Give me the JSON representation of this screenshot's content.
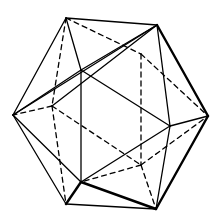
{
  "figure": {
    "stroke_color": "#000000",
    "background": "#ffffff",
    "vertices": {
      "A": [
        66,
        18
      ],
      "B": [
        157,
        25
      ],
      "C": [
        13,
        115
      ],
      "D": [
        81,
        70
      ],
      "E": [
        170,
        126
      ],
      "F": [
        208,
        116
      ],
      "G": [
        81,
        182
      ],
      "H": [
        66,
        204
      ],
      "I": [
        156,
        209
      ],
      "J": [
        52,
        106
      ],
      "K": [
        141,
        54
      ],
      "L": [
        141,
        165
      ]
    },
    "solid_edges": [
      [
        "A",
        "B"
      ],
      [
        "A",
        "C"
      ],
      [
        "A",
        "D"
      ],
      [
        "B",
        "D"
      ],
      [
        "B",
        "F"
      ],
      [
        "B",
        "E"
      ],
      [
        "B",
        "C"
      ],
      [
        "C",
        "D"
      ],
      [
        "C",
        "G"
      ],
      [
        "C",
        "H"
      ],
      [
        "D",
        "G"
      ],
      [
        "D",
        "E"
      ],
      [
        "E",
        "F"
      ],
      [
        "E",
        "G"
      ],
      [
        "E",
        "I"
      ],
      [
        "F",
        "I"
      ],
      [
        "G",
        "H"
      ],
      [
        "G",
        "I"
      ],
      [
        "H",
        "I"
      ],
      [
        "J",
        "B"
      ]
    ],
    "thick_edges": [
      [
        "B",
        "F"
      ],
      [
        "F",
        "I"
      ],
      [
        "G",
        "I"
      ],
      [
        "G",
        "H"
      ]
    ],
    "dashed_edges": [
      [
        "A",
        "K"
      ],
      [
        "A",
        "J"
      ],
      [
        "K",
        "L"
      ],
      [
        "K",
        "F"
      ],
      [
        "J",
        "C"
      ],
      [
        "J",
        "L"
      ],
      [
        "J",
        "H"
      ],
      [
        "L",
        "F"
      ],
      [
        "L",
        "I"
      ],
      [
        "L",
        "G"
      ]
    ]
  }
}
